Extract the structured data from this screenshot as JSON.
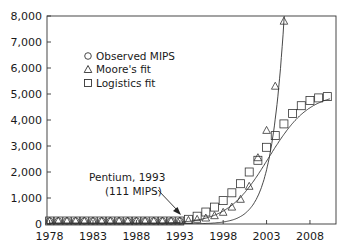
{
  "chart_data": {
    "type": "line",
    "title": "",
    "xlabel": "",
    "ylabel": "",
    "xlim": [
      1977.7,
      2011
    ],
    "ylim": [
      0,
      8000
    ],
    "grid": false,
    "legend_position": "upper-left-inside",
    "x_ticks": [
      1978,
      1983,
      1988,
      1993,
      1998,
      2003,
      2008
    ],
    "x_tick_labels": [
      "1978",
      "1983",
      "1988",
      "1993",
      "1998",
      "2003",
      "2008"
    ],
    "y_ticks": [
      0,
      1000,
      2000,
      3000,
      4000,
      5000,
      6000,
      7000,
      8000
    ],
    "y_tick_labels": [
      "0",
      "1,000",
      "2,000",
      "3,000",
      "4,000",
      "5,000",
      "6,000",
      "7,000",
      "8,000"
    ],
    "legend": [
      {
        "label": "Observed MIPS",
        "marker": "circle"
      },
      {
        "label": "Moore's fit",
        "marker": "triangle"
      },
      {
        "label": "Logistics fit",
        "marker": "square"
      }
    ],
    "series": [
      {
        "name": "Observed MIPS",
        "marker": "circle",
        "x": [
          1978,
          1979,
          1980,
          1981,
          1982,
          1983,
          1984,
          1985,
          1986,
          1987,
          1988,
          1989,
          1990,
          1991,
          1992,
          1993
        ],
        "values": [
          1,
          1,
          1,
          1,
          2,
          2,
          3,
          4,
          5,
          7,
          9,
          15,
          25,
          40,
          66,
          111
        ]
      },
      {
        "name": "Moore's fit",
        "marker": "triangle",
        "x": [
          1978,
          1979,
          1980,
          1981,
          1982,
          1983,
          1984,
          1985,
          1986,
          1987,
          1988,
          1989,
          1990,
          1991,
          1992,
          1993,
          1994,
          1995,
          1996,
          1997,
          1998,
          1999,
          2000,
          2001,
          2002,
          2003,
          2004,
          2005
        ],
        "values": [
          0,
          0,
          0,
          1,
          1,
          1,
          2,
          3,
          4,
          6,
          10,
          15,
          23,
          35,
          55,
          90,
          140,
          180,
          230,
          320,
          450,
          650,
          950,
          1450,
          2550,
          3600,
          5300,
          7800
        ]
      },
      {
        "name": "Logistics fit",
        "marker": "square",
        "x": [
          1978,
          1979,
          1980,
          1981,
          1982,
          1983,
          1984,
          1985,
          1986,
          1987,
          1988,
          1989,
          1990,
          1991,
          1992,
          1993,
          1994,
          1995,
          1996,
          1997,
          1998,
          1999,
          2000,
          2001,
          2002,
          2003,
          2004,
          2005,
          2006,
          2007,
          2008,
          2009,
          2010
        ],
        "values": [
          0,
          0,
          0,
          0,
          0,
          0,
          0,
          0,
          0,
          0,
          0,
          0,
          0,
          5,
          30,
          80,
          180,
          300,
          460,
          650,
          900,
          1200,
          1550,
          2000,
          2450,
          2950,
          3400,
          3850,
          4250,
          4550,
          4750,
          4850,
          4900
        ]
      }
    ],
    "annotations": [
      {
        "text_line1": "Pentium, 1993",
        "text_line2": "(111 MIPS)",
        "points_to": {
          "x": 1993,
          "y": 111
        }
      }
    ]
  },
  "labels": {
    "annotation_line1": "Pentium, 1993",
    "annotation_line2": "(111 MIPS)",
    "legend_observed": "Observed MIPS",
    "legend_moore": "Moore's fit",
    "legend_logistics": "Logistics fit"
  }
}
